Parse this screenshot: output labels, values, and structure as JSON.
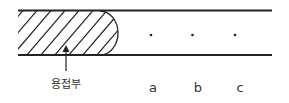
{
  "diagram": {
    "weld_label": "용접부",
    "points": [
      {
        "label": "a"
      },
      {
        "label": "b"
      },
      {
        "label": "c"
      }
    ],
    "colors": {
      "line": "#222222",
      "text": "#333333",
      "background": "#ffffff"
    }
  }
}
